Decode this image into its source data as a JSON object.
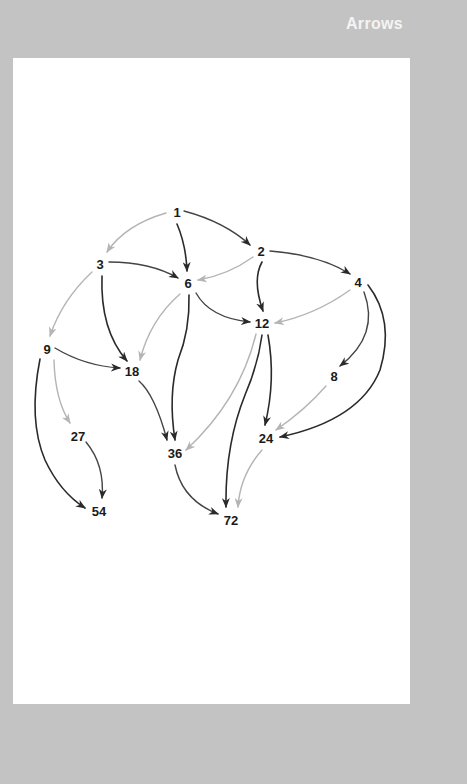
{
  "header": {
    "title": "Arrows"
  },
  "colors": {
    "background": "#c3c3c3",
    "panel": "#ffffff",
    "dark_arrow": "#2a2a2a",
    "light_arrow": "#b4b4b4",
    "text": "#1a1a1a",
    "title": "#f4f4f4"
  },
  "diagram": {
    "nodes": [
      {
        "id": "n1",
        "label": "1",
        "x": 177,
        "y": 212
      },
      {
        "id": "n2",
        "label": "2",
        "x": 261,
        "y": 251
      },
      {
        "id": "n3",
        "label": "3",
        "x": 100,
        "y": 264
      },
      {
        "id": "n6",
        "label": "6",
        "x": 188,
        "y": 283
      },
      {
        "id": "n4",
        "label": "4",
        "x": 358,
        "y": 282
      },
      {
        "id": "n12",
        "label": "12",
        "x": 262,
        "y": 323
      },
      {
        "id": "n9",
        "label": "9",
        "x": 47,
        "y": 349
      },
      {
        "id": "n18",
        "label": "18",
        "x": 132,
        "y": 371
      },
      {
        "id": "n8",
        "label": "8",
        "x": 334,
        "y": 376
      },
      {
        "id": "n27",
        "label": "27",
        "x": 78,
        "y": 436
      },
      {
        "id": "n24",
        "label": "24",
        "x": 266,
        "y": 438
      },
      {
        "id": "n36",
        "label": "36",
        "x": 175,
        "y": 453
      },
      {
        "id": "n54",
        "label": "54",
        "x": 99,
        "y": 511
      },
      {
        "id": "n72",
        "label": "72",
        "x": 231,
        "y": 520
      }
    ],
    "edges": [
      {
        "from": "1",
        "to": "3",
        "style": "light"
      },
      {
        "from": "1",
        "to": "6",
        "style": "dark"
      },
      {
        "from": "1",
        "to": "2",
        "style": "dark"
      },
      {
        "from": "2",
        "to": "6",
        "style": "light"
      },
      {
        "from": "2",
        "to": "12",
        "style": "dark"
      },
      {
        "from": "2",
        "to": "4",
        "style": "dark"
      },
      {
        "from": "3",
        "to": "6",
        "style": "dark"
      },
      {
        "from": "3",
        "to": "18",
        "style": "dark"
      },
      {
        "from": "3",
        "to": "9",
        "style": "light"
      },
      {
        "from": "6",
        "to": "18",
        "style": "light"
      },
      {
        "from": "6",
        "to": "36",
        "style": "dark"
      },
      {
        "from": "6",
        "to": "12",
        "style": "dark"
      },
      {
        "from": "4",
        "to": "12",
        "style": "light"
      },
      {
        "from": "4",
        "to": "8",
        "style": "dark"
      },
      {
        "from": "4",
        "to": "24",
        "style": "dark"
      },
      {
        "from": "9",
        "to": "18",
        "style": "dark"
      },
      {
        "from": "9",
        "to": "27",
        "style": "light"
      },
      {
        "from": "9",
        "to": "54",
        "style": "dark"
      },
      {
        "from": "12",
        "to": "36",
        "style": "light"
      },
      {
        "from": "12",
        "to": "72",
        "style": "dark"
      },
      {
        "from": "12",
        "to": "24",
        "style": "dark"
      },
      {
        "from": "18",
        "to": "36",
        "style": "dark"
      },
      {
        "from": "8",
        "to": "24",
        "style": "light"
      },
      {
        "from": "27",
        "to": "54",
        "style": "dark"
      },
      {
        "from": "36",
        "to": "72",
        "style": "dark"
      },
      {
        "from": "24",
        "to": "72",
        "style": "light"
      }
    ]
  }
}
